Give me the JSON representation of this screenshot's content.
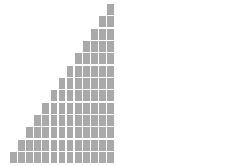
{
  "figure": {
    "title": "",
    "background_color": "#ffffff",
    "width": 239,
    "height": 166
  },
  "chart_data": [
    {
      "id": "left-staircase",
      "type": "bar",
      "title": "",
      "subtitle": "",
      "xlabel": "",
      "ylabel": "",
      "grid": false,
      "legend": "none",
      "fill_color": "#a9a9a9",
      "gap_color": "#ffffff",
      "cell_count": 13,
      "columns": 13,
      "rows": 13,
      "categories": [
        "1",
        "2",
        "3",
        "4",
        "5",
        "6",
        "7",
        "8",
        "9",
        "10",
        "11",
        "12",
        "13"
      ],
      "values": [
        1,
        2,
        3,
        4,
        5,
        6,
        7,
        8,
        9,
        10,
        11,
        12,
        13
      ],
      "ylim": [
        0,
        13
      ],
      "total_filled_cells": 91
    },
    {
      "id": "right-staircase",
      "type": "bar",
      "title": "",
      "subtitle": "",
      "xlabel": "",
      "ylabel": "",
      "grid": false,
      "legend": "none",
      "fill_color": "#a9a9a9",
      "gap_color": "#ffffff",
      "cell_count": 26,
      "columns": 26,
      "rows": 26,
      "categories": [
        "1",
        "2",
        "3",
        "4",
        "5",
        "6",
        "7",
        "8",
        "9",
        "10",
        "11",
        "12",
        "13",
        "14",
        "15",
        "16",
        "17",
        "18",
        "19",
        "20",
        "21",
        "22",
        "23",
        "24",
        "25",
        "26"
      ],
      "values": [
        1,
        2,
        3,
        4,
        5,
        6,
        7,
        8,
        9,
        10,
        11,
        12,
        13,
        14,
        15,
        16,
        17,
        18,
        19,
        20,
        21,
        22,
        23,
        24,
        25,
        26
      ],
      "ylim": [
        0,
        26
      ],
      "total_filled_cells": 351
    }
  ],
  "panels": [
    {
      "name": "left-panel",
      "chart_index": 0,
      "x": 10,
      "y": 4,
      "width": 104,
      "height": 159,
      "cell_gap": 1.5
    },
    {
      "name": "right-panel",
      "chart_index": 1,
      "x": 133,
      "y": 4,
      "width": 99,
      "height": 159,
      "cell_gap": 1
    }
  ]
}
